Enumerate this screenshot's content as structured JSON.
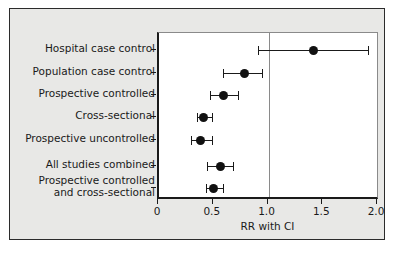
{
  "chart_data": {
    "type": "scatter",
    "title": "",
    "subtitle": "",
    "xlabel": "RR with CI",
    "ylabel": "",
    "xlim": [
      0,
      2.0
    ],
    "xticks": [
      "0",
      "0.5",
      "1.0",
      "1.5",
      "2.0"
    ],
    "xtick_values": [
      0,
      0.5,
      1.0,
      1.5,
      2.0
    ],
    "grid": false,
    "legend": "none",
    "reference_line": 1.0,
    "categories": [
      "Hospital case control",
      "Population case control",
      "Prospective controlled",
      "Cross-sectional",
      "Prospective uncontrolled",
      "All studies combined",
      "Prospective controlled\nand cross-sectional"
    ],
    "series": [
      {
        "name": "RR with CI",
        "points": [
          {
            "label": "Hospital case control",
            "value": 1.41,
            "low": 0.9,
            "high": 1.91
          },
          {
            "label": "Population case control",
            "value": 0.78,
            "low": 0.58,
            "high": 0.94
          },
          {
            "label": "Prospective controlled",
            "value": 0.59,
            "low": 0.47,
            "high": 0.72
          },
          {
            "label": "Cross-sectional",
            "value": 0.41,
            "low": 0.35,
            "high": 0.48
          },
          {
            "label": "Prospective uncontrolled",
            "value": 0.38,
            "low": 0.29,
            "high": 0.48
          },
          {
            "label": "All studies combined",
            "value": 0.56,
            "low": 0.44,
            "high": 0.68
          },
          {
            "label": "Prospective controlled and cross-sectional",
            "value": 0.5,
            "low": 0.43,
            "high": 0.58
          }
        ]
      }
    ],
    "colors": {
      "marker": "#111111",
      "ci_line": "#1a1a1a",
      "reference_line": "#8a8a8a",
      "panel_background": "#e8e8e6",
      "plot_background": "#ffffff",
      "axis": "#1a1a1a"
    }
  }
}
